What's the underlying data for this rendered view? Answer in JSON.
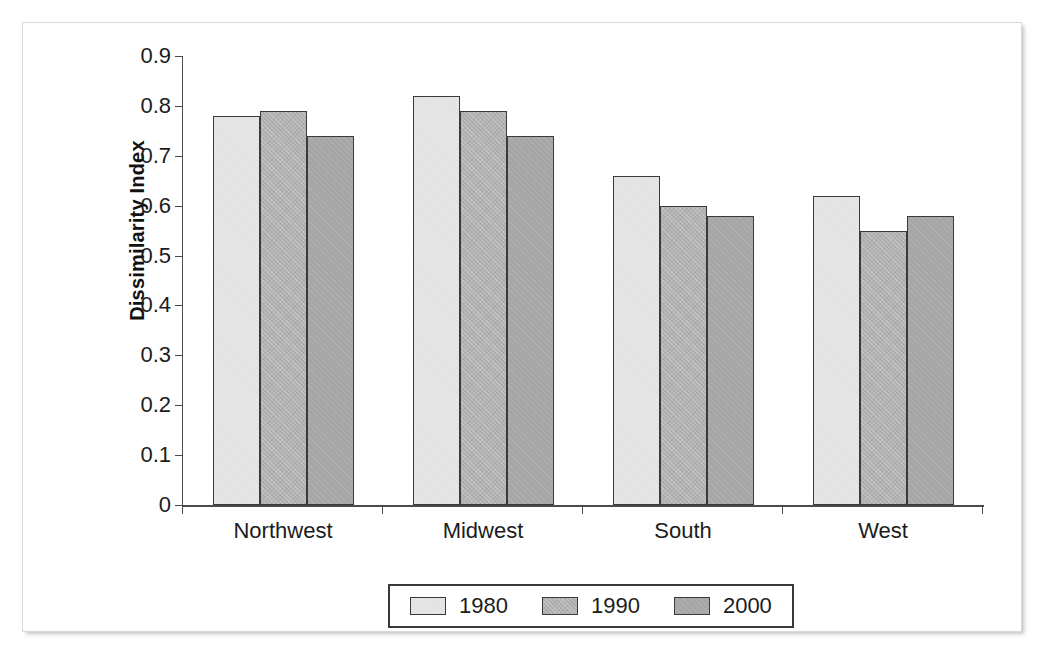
{
  "chart_data": {
    "type": "bar",
    "title": "",
    "xlabel": "",
    "ylabel": "Dissimilarity Index",
    "categories": [
      "Northwest",
      "Midwest",
      "South",
      "West"
    ],
    "series": [
      {
        "name": "1980",
        "color": "#e6e6e6",
        "values": [
          0.78,
          0.82,
          0.66,
          0.62
        ]
      },
      {
        "name": "1990",
        "color": "#b2b2b2",
        "values": [
          0.79,
          0.79,
          0.6,
          0.55
        ]
      },
      {
        "name": "2000",
        "color": "#a6a6a6",
        "values": [
          0.74,
          0.74,
          0.58,
          0.58
        ]
      }
    ],
    "ylim": [
      0,
      0.9
    ],
    "yticks": [
      "0",
      "0.1",
      "0.2",
      "0.3",
      "0.4",
      "0.5",
      "0.6",
      "0.7",
      "0.8",
      "0.9"
    ],
    "ytick_values": [
      0,
      0.1,
      0.2,
      0.3,
      0.4,
      0.5,
      0.6,
      0.7,
      0.8,
      0.9
    ],
    "grid": false,
    "legend_position": "bottom"
  },
  "axis": {
    "y_title": "Dissimilarity Index"
  },
  "legend": {
    "entries": [
      {
        "label": "1980"
      },
      {
        "label": "1990"
      },
      {
        "label": "2000"
      }
    ]
  }
}
